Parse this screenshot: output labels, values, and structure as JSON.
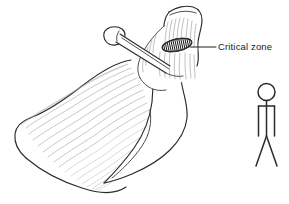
{
  "figure": {
    "background_color": "#ffffff",
    "line_color": "#2b2b2b",
    "striation_color": "#9a9a9a",
    "width": 289,
    "height": 204
  },
  "annotations": {
    "critical_zone": {
      "label": "Critical zone",
      "text_x": 218,
      "text_y": 47,
      "leader_from_x": 190,
      "leader_from_y": 47,
      "leader_to_x": 216,
      "leader_to_y": 47,
      "marker_type": "hatched-ellipse",
      "marker_cx": 177,
      "marker_cy": 45,
      "marker_rx": 15,
      "marker_ry": 6,
      "marker_rotation": -12,
      "marker_hatch_count": 15,
      "marker_color": "#1a1a1a"
    }
  },
  "structures": {
    "muscle_belly": {
      "name": "supraspinatus muscle belly",
      "striation_count": 18
    },
    "humeral_head": {
      "name": "humeral head greater tuberosity"
    },
    "acromion_bone": {
      "name": "acromion / scapular spine"
    },
    "nail_implant": {
      "name": "pin implant",
      "head_cx": 114,
      "head_cy": 35
    }
  },
  "scale_figure": {
    "name": "human scale stick figure",
    "head_cx": 266.5,
    "head_cy": 92,
    "head_r": 8.5,
    "neck_y": 100.5,
    "hip_y": 136,
    "arm_left_x": 258,
    "arm_right_x": 275,
    "arm_top_y": 106,
    "arm_bottom_y": 136,
    "leg_left_x": 256,
    "leg_right_x": 277,
    "leg_bottom_y": 166,
    "stroke_color": "#2b2b2b"
  }
}
